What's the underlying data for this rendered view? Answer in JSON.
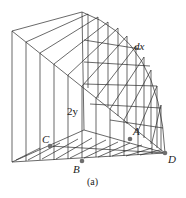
{
  "figure": {
    "caption": "(a)",
    "labels": {
      "dx": "dx",
      "two_y": "2y",
      "A": "A",
      "B": "B",
      "C": "C",
      "D": "D"
    },
    "colors": {
      "line": "#2a2a2a",
      "point": "#6e6e6e",
      "background": "#ffffff"
    },
    "points": {
      "A": [
        130,
        139
      ],
      "B": [
        82,
        161
      ],
      "C": [
        50,
        146
      ],
      "D": [
        165,
        153
      ]
    }
  }
}
